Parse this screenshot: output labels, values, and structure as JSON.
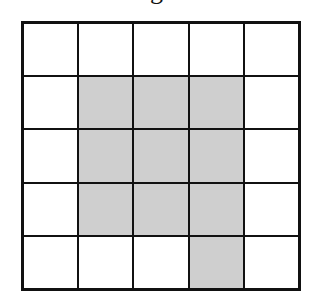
{
  "caption": "g",
  "grid": {
    "rows": 5,
    "cols": 5,
    "shade_color": "#cfcfcf",
    "line_color": "#111111",
    "cells": [
      [
        0,
        0,
        0,
        0,
        0
      ],
      [
        0,
        1,
        1,
        1,
        0
      ],
      [
        0,
        1,
        1,
        1,
        0
      ],
      [
        0,
        1,
        1,
        1,
        0
      ],
      [
        0,
        0,
        0,
        1,
        0
      ]
    ]
  }
}
